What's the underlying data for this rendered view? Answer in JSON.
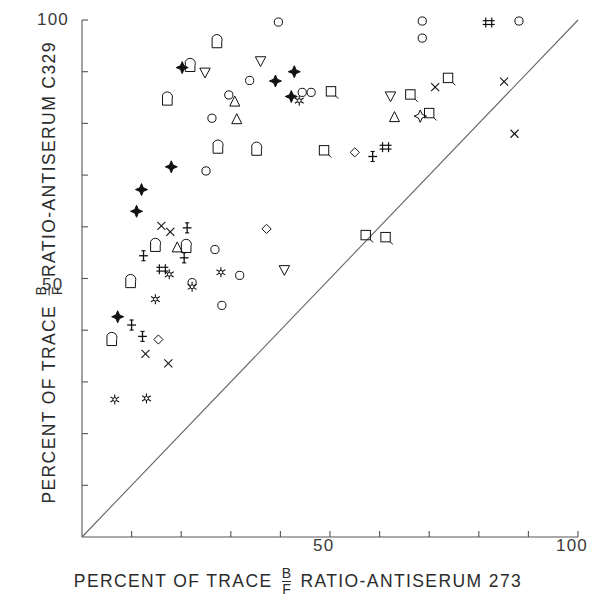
{
  "axes": {
    "x_label_prefix": "PERCENT OF TRACE",
    "x_label_suffix": "RATIO-ANTISERUM 273",
    "y_label_prefix": "PERCENT OF TRACE",
    "y_label_suffix": "RATIO-ANTISERUM C329",
    "frac_num": "B",
    "frac_den": "F",
    "x_ticklabel_50": "50",
    "x_ticklabel_100": "100",
    "y_ticklabel_50": "50",
    "y_ticklabel_100": "100"
  },
  "chart_data": {
    "type": "scatter",
    "title": "",
    "xlabel": "PERCENT OF TRACE B/F RATIO-ANTISERUM 273",
    "ylabel": "PERCENT OF TRACE B/F RATIO-ANTISERUM C329",
    "xlim": [
      0,
      100
    ],
    "ylim": [
      0,
      100
    ],
    "xticks": [
      0,
      10,
      20,
      30,
      40,
      50,
      60,
      70,
      80,
      90,
      100
    ],
    "yticks": [
      0,
      10,
      20,
      30,
      40,
      50,
      60,
      70,
      80,
      90,
      100
    ],
    "xtick_labels": {
      "50": "50",
      "100": "100"
    },
    "ytick_labels": {
      "50": "50",
      "100": "100"
    },
    "grid": false,
    "legend": "none",
    "annotations": [
      {
        "type": "identity-line",
        "from": [
          0,
          0
        ],
        "to": [
          100,
          100
        ],
        "note": "line of identity y = x"
      }
    ],
    "marker_kinds": [
      "open-circle",
      "filled-4-star",
      "open-4-star",
      "six-point-star",
      "triangle-up",
      "triangle-down",
      "open-square",
      "d-shape",
      "open-diamond",
      "x-cross",
      "plus-serif",
      "double-plus"
    ],
    "points": [
      {
        "x": 39.6,
        "y": 99.6,
        "m": "open-circle"
      },
      {
        "x": 68.6,
        "y": 99.8,
        "m": "open-circle"
      },
      {
        "x": 68.6,
        "y": 96.5,
        "m": "open-circle"
      },
      {
        "x": 88.1,
        "y": 99.8,
        "m": "open-circle"
      },
      {
        "x": 82.0,
        "y": 99.5,
        "m": "double-plus"
      },
      {
        "x": 27.2,
        "y": 95.6,
        "m": "d-shape"
      },
      {
        "x": 36.0,
        "y": 92.0,
        "m": "triangle-down"
      },
      {
        "x": 20.2,
        "y": 90.8,
        "m": "filled-4-star"
      },
      {
        "x": 21.8,
        "y": 91.0,
        "m": "d-shape"
      },
      {
        "x": 24.8,
        "y": 89.8,
        "m": "triangle-down"
      },
      {
        "x": 33.8,
        "y": 88.3,
        "m": "open-circle"
      },
      {
        "x": 42.8,
        "y": 90.0,
        "m": "filled-4-star"
      },
      {
        "x": 39.0,
        "y": 88.2,
        "m": "filled-4-star"
      },
      {
        "x": 73.8,
        "y": 88.8,
        "m": "open-square"
      },
      {
        "x": 85.1,
        "y": 88.1,
        "m": "x-cross"
      },
      {
        "x": 29.6,
        "y": 85.5,
        "m": "open-circle"
      },
      {
        "x": 30.8,
        "y": 84.2,
        "m": "triangle-up"
      },
      {
        "x": 44.4,
        "y": 86.0,
        "m": "open-circle"
      },
      {
        "x": 46.2,
        "y": 86.0,
        "m": "open-circle"
      },
      {
        "x": 50.2,
        "y": 86.2,
        "m": "open-square"
      },
      {
        "x": 42.2,
        "y": 85.2,
        "m": "filled-4-star"
      },
      {
        "x": 43.8,
        "y": 84.4,
        "m": "six-point-star"
      },
      {
        "x": 17.2,
        "y": 84.5,
        "m": "d-shape"
      },
      {
        "x": 62.2,
        "y": 85.2,
        "m": "triangle-down"
      },
      {
        "x": 66.2,
        "y": 85.6,
        "m": "open-square"
      },
      {
        "x": 71.2,
        "y": 87.0,
        "m": "x-cross"
      },
      {
        "x": 26.2,
        "y": 81.0,
        "m": "open-circle"
      },
      {
        "x": 31.2,
        "y": 80.8,
        "m": "triangle-up"
      },
      {
        "x": 63.0,
        "y": 81.2,
        "m": "triangle-up"
      },
      {
        "x": 68.2,
        "y": 81.4,
        "m": "open-4-star"
      },
      {
        "x": 70.0,
        "y": 82.0,
        "m": "open-square"
      },
      {
        "x": 87.2,
        "y": 78.0,
        "m": "x-cross"
      },
      {
        "x": 27.4,
        "y": 75.2,
        "m": "d-shape"
      },
      {
        "x": 35.2,
        "y": 74.8,
        "m": "d-shape"
      },
      {
        "x": 48.8,
        "y": 74.8,
        "m": "open-square"
      },
      {
        "x": 55.0,
        "y": 74.4,
        "m": "open-diamond"
      },
      {
        "x": 58.6,
        "y": 73.6,
        "m": "plus-serif"
      },
      {
        "x": 61.2,
        "y": 75.4,
        "m": "double-plus"
      },
      {
        "x": 18.0,
        "y": 71.6,
        "m": "filled-4-star"
      },
      {
        "x": 25.0,
        "y": 70.8,
        "m": "open-circle"
      },
      {
        "x": 12.0,
        "y": 67.2,
        "m": "filled-4-star"
      },
      {
        "x": 11.0,
        "y": 63.0,
        "m": "filled-4-star"
      },
      {
        "x": 16.0,
        "y": 60.2,
        "m": "x-cross"
      },
      {
        "x": 17.8,
        "y": 59.0,
        "m": "x-cross"
      },
      {
        "x": 21.2,
        "y": 59.8,
        "m": "plus-serif"
      },
      {
        "x": 37.2,
        "y": 59.6,
        "m": "open-diamond"
      },
      {
        "x": 14.8,
        "y": 56.2,
        "m": "d-shape"
      },
      {
        "x": 19.2,
        "y": 56.0,
        "m": "triangle-up"
      },
      {
        "x": 21.0,
        "y": 56.0,
        "m": "d-shape"
      },
      {
        "x": 26.8,
        "y": 55.6,
        "m": "open-circle"
      },
      {
        "x": 12.4,
        "y": 54.4,
        "m": "plus-serif"
      },
      {
        "x": 20.6,
        "y": 54.0,
        "m": "plus-serif"
      },
      {
        "x": 57.2,
        "y": 58.4,
        "m": "open-square"
      },
      {
        "x": 61.2,
        "y": 58.0,
        "m": "open-square"
      },
      {
        "x": 17.6,
        "y": 50.8,
        "m": "six-point-star"
      },
      {
        "x": 28.0,
        "y": 51.2,
        "m": "six-point-star"
      },
      {
        "x": 9.8,
        "y": 49.2,
        "m": "d-shape"
      },
      {
        "x": 16.2,
        "y": 51.8,
        "m": "double-plus"
      },
      {
        "x": 22.2,
        "y": 49.2,
        "m": "open-circle"
      },
      {
        "x": 22.2,
        "y": 48.4,
        "m": "six-point-star"
      },
      {
        "x": 40.8,
        "y": 51.6,
        "m": "triangle-down"
      },
      {
        "x": 14.8,
        "y": 46.0,
        "m": "six-point-star"
      },
      {
        "x": 31.8,
        "y": 50.6,
        "m": "open-circle"
      },
      {
        "x": 7.2,
        "y": 42.6,
        "m": "filled-4-star"
      },
      {
        "x": 10.0,
        "y": 41.0,
        "m": "plus-serif"
      },
      {
        "x": 28.2,
        "y": 44.8,
        "m": "open-circle"
      },
      {
        "x": 6.0,
        "y": 38.0,
        "m": "d-shape"
      },
      {
        "x": 12.2,
        "y": 38.8,
        "m": "plus-serif"
      },
      {
        "x": 15.4,
        "y": 38.2,
        "m": "open-diamond"
      },
      {
        "x": 12.8,
        "y": 35.4,
        "m": "x-cross"
      },
      {
        "x": 17.4,
        "y": 33.6,
        "m": "x-cross"
      },
      {
        "x": 6.6,
        "y": 26.6,
        "m": "six-point-star"
      },
      {
        "x": 13.0,
        "y": 26.8,
        "m": "six-point-star"
      }
    ]
  }
}
